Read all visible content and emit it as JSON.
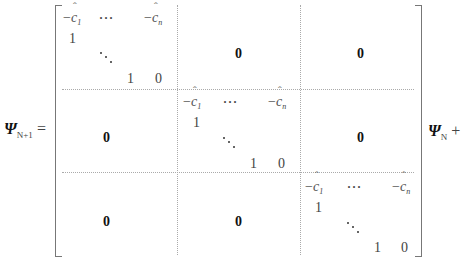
{
  "equation": {
    "lhs": {
      "symbol": "Ψ",
      "subscript": "N+1",
      "operator": "="
    },
    "rhs": {
      "symbol": "Ψ",
      "subscript": "N",
      "operator": "+"
    },
    "matrix": {
      "blocks": [
        {
          "position": "top-left",
          "row1": [
            "−ĉ",
            "1",
            "⋯",
            "−ĉ",
            "n"
          ],
          "first_row": {
            "neg_c1": "−",
            "c1_sub": "1",
            "ellipsis": "···",
            "neg_cn": "−",
            "cn_sub": "n"
          },
          "subdiag_one": "1",
          "last_row": {
            "one": "1",
            "zero": "0"
          }
        },
        {
          "position": "middle",
          "first_row": {
            "neg_c1": "−",
            "c1_sub": "1",
            "ellipsis": "···",
            "neg_cn": "−",
            "cn_sub": "n"
          },
          "subdiag_one": "1",
          "last_row": {
            "one": "1",
            "zero": "0"
          }
        },
        {
          "position": "bottom-right",
          "first_row": {
            "neg_c1": "−",
            "c1_sub": "1",
            "ellipsis": "···",
            "neg_cn": "−",
            "cn_sub": "n"
          },
          "subdiag_one": "1",
          "last_row": {
            "one": "1",
            "zero": "0"
          }
        }
      ],
      "zero_block": "0",
      "c_symbol": "c"
    }
  }
}
